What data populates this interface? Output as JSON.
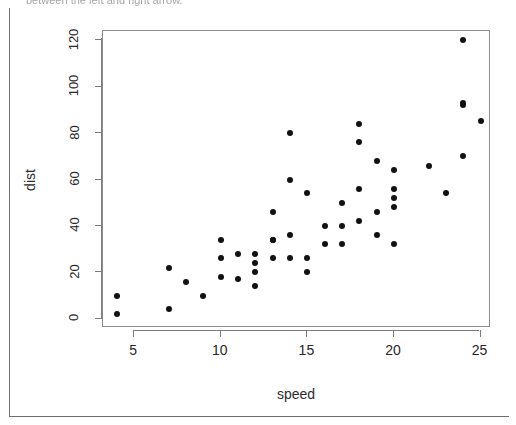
{
  "caption": {
    "text": "between the left and right arrow."
  },
  "chart_data": {
    "type": "scatter",
    "title": "",
    "xlabel": "speed",
    "ylabel": "dist",
    "xlim": [
      3.2,
      25.6
    ],
    "ylim": [
      -4,
      124
    ],
    "xticks": [
      5,
      10,
      15,
      20,
      25
    ],
    "yticks": [
      0,
      20,
      40,
      60,
      80,
      100,
      120
    ],
    "grid": false,
    "legend": null,
    "marker": "filled-circle",
    "marker_color": "#111111",
    "n_points": 50,
    "x": [
      4,
      4,
      7,
      7,
      8,
      9,
      10,
      10,
      10,
      11,
      11,
      12,
      12,
      12,
      12,
      13,
      13,
      13,
      13,
      14,
      14,
      14,
      14,
      15,
      15,
      15,
      16,
      16,
      17,
      17,
      17,
      18,
      18,
      18,
      18,
      19,
      19,
      19,
      20,
      20,
      20,
      20,
      20,
      22,
      23,
      24,
      24,
      24,
      24,
      25
    ],
    "y": [
      2,
      10,
      4,
      22,
      16,
      10,
      18,
      26,
      34,
      17,
      28,
      14,
      20,
      24,
      28,
      26,
      34,
      34,
      46,
      26,
      36,
      60,
      80,
      20,
      26,
      54,
      32,
      40,
      32,
      40,
      50,
      42,
      56,
      76,
      84,
      36,
      46,
      68,
      32,
      48,
      52,
      56,
      64,
      66,
      54,
      70,
      92,
      93,
      120,
      85
    ]
  },
  "axis_labels": {
    "x_ticks": [
      "5",
      "10",
      "15",
      "20",
      "25"
    ],
    "y_ticks": [
      "0",
      "20",
      "40",
      "60",
      "80",
      "100",
      "120"
    ]
  }
}
